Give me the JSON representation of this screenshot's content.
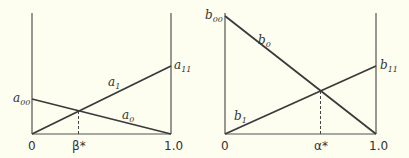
{
  "diagrams": [
    {
      "name": "left",
      "x_ticks": {
        "zero": "0",
        "one": "1.0",
        "star": "β*"
      },
      "labels": {
        "line_up": {
          "base": "a",
          "sub": "1"
        },
        "line_down": {
          "base": "a",
          "sub": "0"
        },
        "left_value": {
          "base": "a",
          "sub": "00"
        },
        "right_value": {
          "base": "a",
          "sub": "11"
        }
      }
    },
    {
      "name": "right",
      "x_ticks": {
        "zero": "0",
        "one": "1.0",
        "star": "α*"
      },
      "labels": {
        "line_up": {
          "base": "b",
          "sub": "1"
        },
        "line_down": {
          "base": "b",
          "sub": "0"
        },
        "left_value": {
          "base": "b",
          "sub": "00"
        },
        "right_value": {
          "base": "b",
          "sub": "11"
        }
      }
    }
  ],
  "colors": {
    "line": "#3a3a3a",
    "axis": "#555555",
    "background": "#fdfdf0"
  }
}
